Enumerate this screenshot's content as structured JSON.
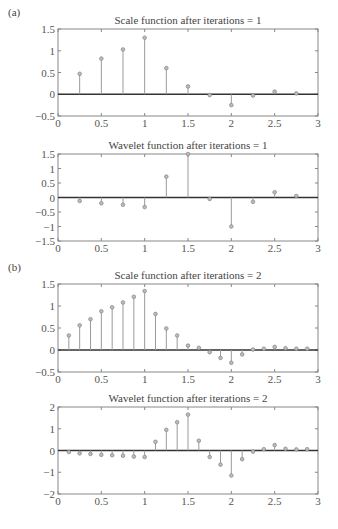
{
  "panels": {
    "a": {
      "label": "(a)"
    },
    "b": {
      "label": "(b)"
    }
  },
  "colors": {
    "axis": "#888888",
    "zero_line": "#333333",
    "stem": "#9a9a9a",
    "marker": "#8a8a8a",
    "text": "#444444"
  },
  "chart_data": [
    {
      "type": "stem",
      "panel": "(a)",
      "title": "Scale function after iterations = 1",
      "xlabel": "",
      "ylabel": "",
      "xlim": [
        0,
        3
      ],
      "ylim": [
        -0.5,
        1.5
      ],
      "xticks": [
        "0",
        "0.5",
        "1",
        "1.5",
        "2",
        "2.5",
        "3"
      ],
      "yticks": [
        "1.5",
        "1",
        "0.5",
        "0",
        "−0.5"
      ],
      "x": [
        0.25,
        0.5,
        0.75,
        1.0,
        1.25,
        1.5,
        1.75,
        2.0,
        2.25,
        2.5,
        2.75
      ],
      "values": [
        0.47,
        0.82,
        1.03,
        1.3,
        0.6,
        0.18,
        -0.02,
        -0.25,
        -0.03,
        0.06,
        0.02
      ],
      "grid": false,
      "box": [
        58,
        29,
        318,
        116
      ]
    },
    {
      "type": "stem",
      "panel": "(a)",
      "title": "Wavelet function after iterations = 1",
      "xlabel": "",
      "ylabel": "",
      "xlim": [
        0,
        3
      ],
      "ylim": [
        -1.5,
        1.5
      ],
      "xticks": [
        "0",
        "0.5",
        "1",
        "1.5",
        "2",
        "2.5",
        "3"
      ],
      "yticks": [
        "1.5",
        "1",
        "0.5",
        "0",
        "−0.5",
        "−1",
        "−1.5"
      ],
      "x": [
        0.25,
        0.5,
        0.75,
        1.0,
        1.25,
        1.5,
        1.75,
        2.0,
        2.25,
        2.5,
        2.75
      ],
      "values": [
        -0.12,
        -0.2,
        -0.25,
        -0.33,
        0.72,
        1.5,
        -0.05,
        -1.0,
        -0.15,
        0.18,
        0.05
      ],
      "grid": false,
      "box": [
        58,
        154,
        318,
        241
      ]
    },
    {
      "type": "stem",
      "panel": "(b)",
      "title": "Scale function after iterations = 2",
      "xlabel": "",
      "ylabel": "",
      "xlim": [
        0,
        3
      ],
      "ylim": [
        -0.5,
        1.5
      ],
      "xticks": [
        "0",
        "0.5",
        "1",
        "1.5",
        "2",
        "2.5",
        "3"
      ],
      "yticks": [
        "1.5",
        "1",
        "0.5",
        "0",
        "−0.5"
      ],
      "x": [
        0.125,
        0.25,
        0.375,
        0.5,
        0.625,
        0.75,
        0.875,
        1.0,
        1.125,
        1.25,
        1.375,
        1.5,
        1.625,
        1.75,
        1.875,
        2.0,
        2.125,
        2.25,
        2.375,
        2.5,
        2.625,
        2.75,
        2.875
      ],
      "values": [
        0.33,
        0.56,
        0.7,
        0.88,
        0.97,
        1.08,
        1.21,
        1.34,
        0.82,
        0.49,
        0.33,
        0.1,
        0.05,
        -0.05,
        -0.18,
        -0.29,
        -0.1,
        0.01,
        0.03,
        0.07,
        0.04,
        0.03,
        0.03
      ],
      "grid": false,
      "box": [
        58,
        284,
        318,
        372
      ]
    },
    {
      "type": "stem",
      "panel": "(b)",
      "title": "Wavelet function after iterations = 2",
      "xlabel": "",
      "ylabel": "",
      "xlim": [
        0,
        3
      ],
      "ylim": [
        -2,
        2
      ],
      "xticks": [
        "0",
        "0.5",
        "1",
        "1.5",
        "2",
        "2.5",
        "3"
      ],
      "yticks": [
        "2",
        "1",
        "0",
        "−1",
        "−2"
      ],
      "x": [
        0.125,
        0.25,
        0.375,
        0.5,
        0.625,
        0.75,
        0.875,
        1.0,
        1.125,
        1.25,
        1.375,
        1.5,
        1.625,
        1.75,
        1.875,
        2.0,
        2.125,
        2.25,
        2.375,
        2.5,
        2.625,
        2.75,
        2.875
      ],
      "values": [
        -0.07,
        -0.13,
        -0.16,
        -0.2,
        -0.22,
        -0.24,
        -0.28,
        -0.3,
        0.4,
        0.95,
        1.3,
        1.65,
        0.45,
        -0.3,
        -0.65,
        -1.15,
        -0.4,
        -0.05,
        0.06,
        0.25,
        0.08,
        0.05,
        0.06
      ],
      "grid": false,
      "box": [
        58,
        407,
        318,
        494
      ]
    }
  ]
}
